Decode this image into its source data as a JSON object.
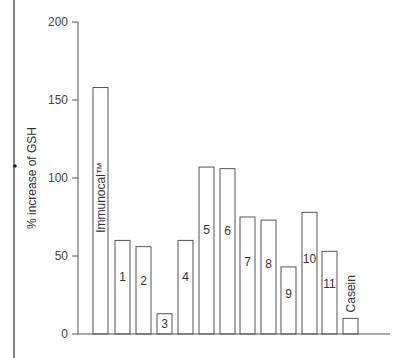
{
  "chart_data": {
    "type": "bar",
    "title": "",
    "xlabel": "",
    "ylabel": "% increase of GSH",
    "ylim": [
      0,
      200
    ],
    "yticks": [
      0,
      50,
      100,
      150,
      200
    ],
    "grid": false,
    "categories": [
      "Immunocal™",
      "1",
      "2",
      "3",
      "4",
      "5",
      "6",
      "7",
      "8",
      "9",
      "10",
      "11",
      "Casein"
    ],
    "values": [
      158,
      60,
      56,
      13,
      60,
      107,
      106,
      75,
      73,
      43,
      78,
      53,
      10
    ],
    "bar_labels": [
      {
        "text": "Immunocal™",
        "orientation": "vertical"
      },
      {
        "text": "1",
        "orientation": "horizontal"
      },
      {
        "text": "2",
        "orientation": "horizontal"
      },
      {
        "text": "3",
        "orientation": "horizontal"
      },
      {
        "text": "4",
        "orientation": "horizontal"
      },
      {
        "text": "5",
        "orientation": "horizontal"
      },
      {
        "text": "6",
        "orientation": "horizontal"
      },
      {
        "text": "7",
        "orientation": "horizontal"
      },
      {
        "text": "8",
        "orientation": "horizontal"
      },
      {
        "text": "9",
        "orientation": "horizontal"
      },
      {
        "text": "10",
        "orientation": "horizontal"
      },
      {
        "text": "11",
        "orientation": "horizontal"
      },
      {
        "text": "Casein",
        "orientation": "vertical-above"
      }
    ],
    "colors": {
      "bar_fill": "#ffffff",
      "bar_stroke": "#555555",
      "axis": "#555555"
    }
  }
}
